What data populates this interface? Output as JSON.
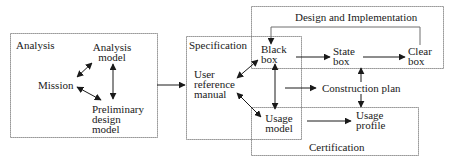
{
  "colors": {
    "background": "#ffffff",
    "stroke": "#1a1a1a",
    "box_border": "#6e6e6e"
  },
  "regions": {
    "analysis": "Analysis",
    "specification": "Specification",
    "design": "Design and Implementation",
    "certification": "Certification"
  },
  "nodes": {
    "analysis_model": "Analysis\nmodel",
    "mission": "Mission",
    "preliminary_design_model": "Preliminary\ndesign\nmodel",
    "user_reference_manual": "User\nreference\nmanual",
    "black_box": "Black\nbox",
    "state_box": "State\nbox",
    "clear_box": "Clear\nbox",
    "construction_plan": "Construction plan",
    "usage_model": "Usage\nmodel",
    "usage_profile": "Usage\nprofile"
  },
  "edges": [
    {
      "from": "mission",
      "to": "analysis_model",
      "type": "bidirectional"
    },
    {
      "from": "mission",
      "to": "preliminary_design_model",
      "type": "bidirectional"
    },
    {
      "from": "analysis_model",
      "to": "preliminary_design_model",
      "type": "bidirectional"
    },
    {
      "from": "analysis",
      "to": "specification",
      "type": "directed"
    },
    {
      "from": "user_reference_manual",
      "to": "black_box",
      "type": "bidirectional"
    },
    {
      "from": "user_reference_manual",
      "to": "usage_model",
      "type": "bidirectional"
    },
    {
      "from": "black_box",
      "to": "usage_model",
      "type": "bidirectional"
    },
    {
      "from": "black_box",
      "to": "state_box",
      "type": "directed"
    },
    {
      "from": "state_box",
      "to": "clear_box",
      "type": "directed"
    },
    {
      "from": "clear_box",
      "to": "black_box",
      "type": "directed",
      "note": "feedback loop over top"
    },
    {
      "from": "specification",
      "to": "construction_plan",
      "type": "directed"
    },
    {
      "from": "construction_plan",
      "to": "design",
      "type": "directed"
    },
    {
      "from": "construction_plan",
      "to": "usage_profile",
      "type": "directed"
    },
    {
      "from": "usage_model",
      "to": "usage_profile",
      "type": "directed"
    }
  ]
}
